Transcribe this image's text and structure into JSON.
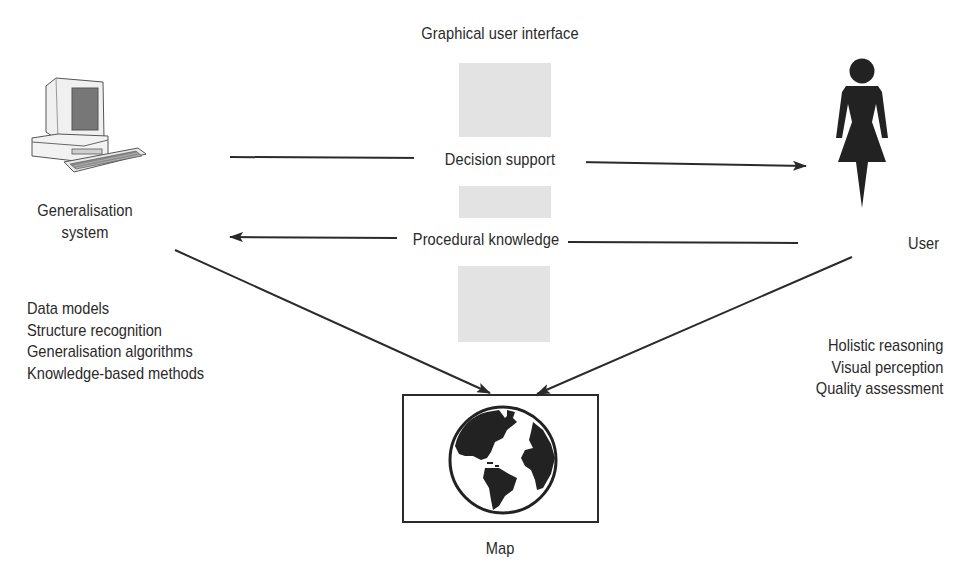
{
  "diagram": {
    "gui_label": "Graphical user interface",
    "arrows": {
      "top": "Decision support",
      "bottom": "Procedural knowledge"
    },
    "system": {
      "icon": "computer-icon",
      "label_line1": "Generalisation",
      "label_line2": "system",
      "capabilities": [
        "Data models",
        "Structure recognition",
        "Generalisation algorithms",
        "Knowledge-based methods"
      ]
    },
    "user": {
      "icon": "woman-user-icon",
      "label": "User",
      "capabilities": [
        "Holistic reasoning",
        "Visual perception",
        "Quality assessment"
      ]
    },
    "map": {
      "icon": "globe-icon",
      "label": "Map"
    },
    "colors": {
      "line": "#2a2a2a",
      "gui_panel": "#e3e3e3"
    }
  }
}
